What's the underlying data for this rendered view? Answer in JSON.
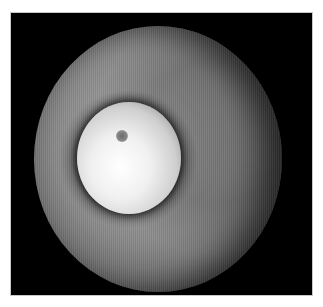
{
  "image": {
    "subject": "grayscale circular fundus-style image with bright central disc",
    "colors": {
      "background": "#ffffff",
      "frame": "#000000",
      "frame_border": "#c8c8c8",
      "field": "#8c8c8c",
      "disc": "#f0f0f0"
    }
  }
}
